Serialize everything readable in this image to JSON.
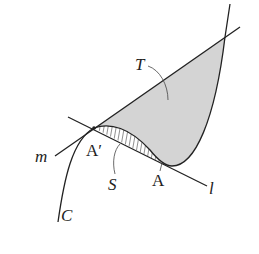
{
  "figure": {
    "labels": {
      "T": "T",
      "S": "S",
      "A": "A",
      "A_prime": "A′",
      "m": "m",
      "l": "l",
      "C": "C"
    },
    "colors": {
      "region_T_fill": "#d4d4d4",
      "stroke": "#222222",
      "background": "#ffffff"
    },
    "elements": {
      "curve": "C",
      "tangent_line_at_A": "l",
      "line_through_A_prime": "m",
      "shaded_region": "T",
      "hatched_region": "S"
    }
  }
}
